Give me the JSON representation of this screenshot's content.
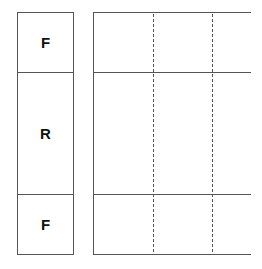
{
  "diagram": {
    "left_column": {
      "cells": [
        {
          "label": "F"
        },
        {
          "label": "R"
        },
        {
          "label": "F"
        }
      ]
    },
    "right_grid": {
      "horizontal_lines": 4,
      "dashed_vertical_lines": 2
    },
    "colors": {
      "line": "#555555",
      "text": "#111111"
    }
  }
}
